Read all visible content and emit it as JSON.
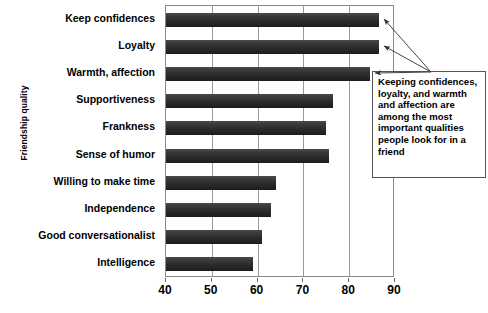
{
  "chart_data": {
    "type": "bar",
    "orientation": "horizontal",
    "title": "",
    "xlabel": "",
    "ylabel": "Friendship quality",
    "xlim": [
      40,
      90
    ],
    "xticks": [
      40,
      50,
      60,
      70,
      80,
      90
    ],
    "grid": true,
    "legend": false,
    "categories": [
      "Keep confidences",
      "Loyalty",
      "Warmth, affection",
      "Supportiveness",
      "Frankness",
      "Sense of humor",
      "Willing to make time",
      "Independence",
      "Good conversationalist",
      "Intelligence"
    ],
    "values": [
      86.5,
      86.5,
      84.5,
      76.5,
      75,
      75.5,
      64,
      63,
      61,
      59
    ],
    "annotations": [
      {
        "text": "Keeping confidences, loyalty, and warmth and affection are among the most important qualities people look for in a friend",
        "points_to": [
          "Keep confidences",
          "Loyalty",
          "Warmth, affection"
        ]
      }
    ],
    "colors": {
      "bar_top": "#4a4a4a",
      "bar_bottom": "#1c1c1c",
      "grid": "#9a9a9a",
      "axis": "#8a8a8a",
      "text": "#000000",
      "annotation_border": "#555555",
      "annotation_background": "#ffffff"
    }
  }
}
